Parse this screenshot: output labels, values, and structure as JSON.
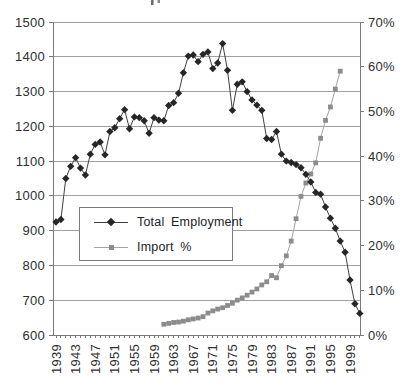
{
  "window": {
    "background": "#ffffff"
  },
  "legend": {
    "items": [
      {
        "label": "Total Employment"
      },
      {
        "label": "Import %"
      }
    ]
  },
  "chart_data": {
    "type": "line",
    "grid": "horizontal",
    "legend_position": "inside-left-middle",
    "colors": {
      "grid": "#a0a0a0",
      "axis": "#7a7a7a",
      "text": "#2e2e2e"
    },
    "left_axis": {
      "min": 600,
      "max": 1500,
      "step": 100,
      "labels": [
        "600",
        "700",
        "800",
        "900",
        "1000",
        "1100",
        "1200",
        "1300",
        "1400",
        "1500"
      ]
    },
    "right_axis": {
      "min": 0,
      "max": 70,
      "step": 10,
      "labels": [
        "0%",
        "10%",
        "20%",
        "30%",
        "40%",
        "50%",
        "60%",
        "70%"
      ]
    },
    "x_axis": {
      "year_min": 1939,
      "year_max": 2001,
      "label_rotation_deg": -90,
      "tick_labels": [
        "1939",
        "1943",
        "1947",
        "1951",
        "1955",
        "1959",
        "1963",
        "1967",
        "1971",
        "1975",
        "1979",
        "1983",
        "1987",
        "1991",
        "1995",
        "1999"
      ]
    },
    "series": [
      {
        "name": "Total Employment",
        "axis": "left",
        "marker": "diamond",
        "color": "#262626",
        "line_color": "#3f3f3f",
        "start_year": 1939,
        "values": [
          925,
          932,
          1050,
          1085,
          1110,
          1080,
          1060,
          1120,
          1148,
          1155,
          1118,
          1185,
          1196,
          1222,
          1248,
          1193,
          1227,
          1225,
          1216,
          1180,
          1225,
          1218,
          1216,
          1260,
          1268,
          1295,
          1354,
          1402,
          1405,
          1386,
          1407,
          1414,
          1366,
          1382,
          1438,
          1361,
          1246,
          1321,
          1328,
          1300,
          1276,
          1261,
          1246,
          1165,
          1162,
          1185,
          1120,
          1100,
          1096,
          1090,
          1081,
          1062,
          1040,
          1010,
          1005,
          968,
          936,
          907,
          870,
          838,
          758,
          690,
          662
        ]
      },
      {
        "name": "Import %",
        "axis": "right",
        "marker": "square",
        "color": "#8c8c8c",
        "line_color": "#a3a3a3",
        "start_year": 1961,
        "values": [
          2.4,
          2.6,
          2.8,
          2.9,
          3.1,
          3.4,
          3.6,
          3.8,
          4.1,
          4.9,
          5.4,
          5.8,
          6.1,
          6.6,
          7.1,
          7.8,
          8.3,
          8.9,
          9.6,
          10.3,
          11.2,
          11.9,
          13.3,
          12.8,
          15.5,
          17.7,
          21.0,
          26.0,
          31.0,
          34.0,
          36.0,
          38.5,
          44.0,
          48.0,
          51.0,
          55.0,
          59.0
        ]
      }
    ]
  }
}
